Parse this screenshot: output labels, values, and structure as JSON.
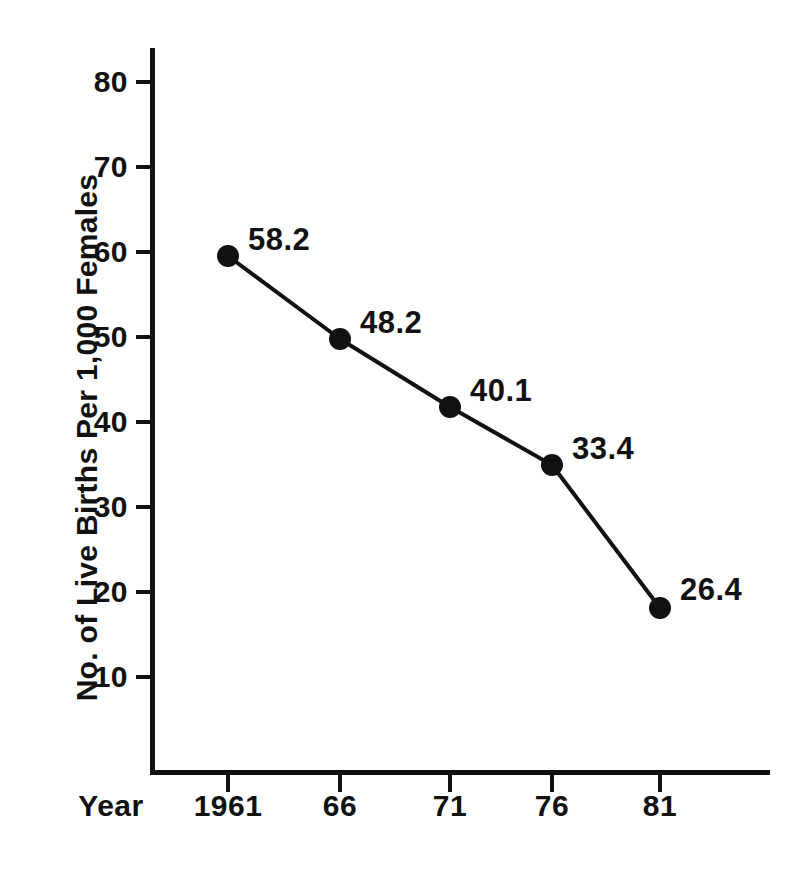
{
  "chart_data": {
    "type": "line",
    "title": "",
    "subtitle": "",
    "xlabel": "Year",
    "ylabel": "No. of Live Births Per 1,000 Females",
    "categories": [
      "1961",
      "66",
      "71",
      "76",
      "81"
    ],
    "x_tick_labels": [
      "1961",
      "66",
      "71",
      "76",
      "81"
    ],
    "y_tick_labels": [
      "80",
      "70",
      "60",
      "50",
      "40",
      "30",
      "20",
      "10"
    ],
    "y_tick_values": [
      80,
      70,
      60,
      50,
      40,
      30,
      20,
      10
    ],
    "values": [
      58.2,
      40.1,
      40.1,
      33.4,
      26.4
    ],
    "data_labels": [
      "58.2",
      "48.2",
      "40.1",
      "33.4",
      "26.4"
    ],
    "series": [
      {
        "name": "Live births per 1,000 females",
        "values": [
          58.2,
          48.2,
          40.1,
          33.4,
          26.4
        ],
        "plotted_values": [
          59.5,
          49.8,
          41.8,
          35.3,
          18.3
        ],
        "marker": "filled-circle",
        "color": "#111111"
      }
    ],
    "xlim": [
      1959.0,
      1986.0
    ],
    "ylim": [
      0,
      84
    ],
    "grid": false,
    "legend": false,
    "legend_position": "none",
    "annotations": []
  },
  "axes": {
    "y_title": "No. of Live Births Per 1,000 Females",
    "x_title": "Year",
    "y_ticks": [
      {
        "label": "80",
        "value": 80,
        "y": 82
      },
      {
        "label": "70",
        "value": 70,
        "y": 167
      },
      {
        "label": "60",
        "value": 60,
        "y": 252
      },
      {
        "label": "50",
        "value": 50,
        "y": 337
      },
      {
        "label": "40",
        "value": 40,
        "y": 422
      },
      {
        "label": "30",
        "value": 30,
        "y": 507
      },
      {
        "label": "20",
        "value": 20,
        "y": 592
      },
      {
        "label": "10",
        "value": 10,
        "y": 677
      }
    ],
    "x_ticks": [
      {
        "label": "1961",
        "x": 228
      },
      {
        "label": "66",
        "x": 340
      },
      {
        "label": "71",
        "x": 450
      },
      {
        "label": "76",
        "x": 552
      },
      {
        "label": "81",
        "x": 660
      }
    ]
  },
  "points": [
    {
      "label": "58.2",
      "x": 228,
      "y": 256,
      "label_x": 248,
      "label_y": 222
    },
    {
      "label": "48.2",
      "x": 340,
      "y": 339,
      "label_x": 360,
      "label_y": 305
    },
    {
      "label": "40.1",
      "x": 450,
      "y": 407,
      "label_x": 470,
      "label_y": 373
    },
    {
      "label": "33.4",
      "x": 552,
      "y": 465,
      "label_x": 572,
      "label_y": 431
    },
    {
      "label": "26.4",
      "x": 660,
      "y": 608,
      "label_x": 680,
      "label_y": 572
    }
  ],
  "style": {
    "background_color": "#ffffff",
    "ink_color": "#111111",
    "line_width": 4,
    "marker_radius": 11
  }
}
